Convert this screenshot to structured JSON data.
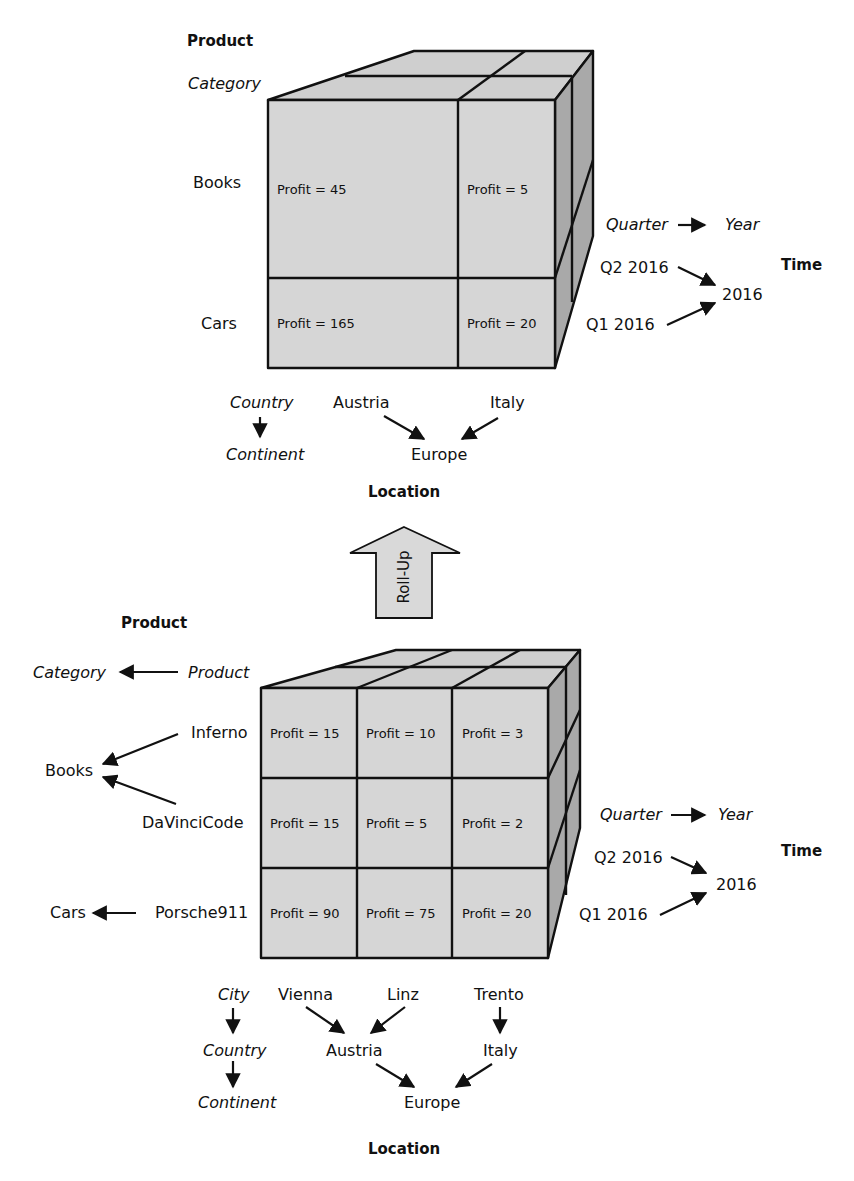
{
  "rolled_up_cube": {
    "product_title": "Product",
    "product_level": "Category",
    "rows": [
      "Books",
      "Cars"
    ],
    "cells": [
      [
        "Profit = 45",
        "Profit = 5"
      ],
      [
        "Profit = 165",
        "Profit = 20"
      ]
    ],
    "time": {
      "title": "Time",
      "hierarchy_from": "Quarter",
      "hierarchy_to": "Year",
      "q2": "Q2 2016",
      "q1": "Q1 2016",
      "year": "2016"
    },
    "location": {
      "title": "Location",
      "level_top": "Country",
      "level_bottom": "Continent",
      "countries": [
        "Austria",
        "Italy"
      ],
      "continent": "Europe"
    }
  },
  "operation": {
    "label": "Roll-Up"
  },
  "base_cube": {
    "product_title": "Product",
    "hierarchy_to": "Category",
    "hierarchy_from": "Product",
    "rows": [
      "Inferno",
      "DaVinciCode",
      "Porsche911"
    ],
    "categories": [
      "Books",
      "Cars"
    ],
    "cells": [
      [
        "Profit = 15",
        "Profit = 10",
        "Profit = 3"
      ],
      [
        "Profit = 15",
        "Profit = 5",
        "Profit = 2"
      ],
      [
        "Profit = 90",
        "Profit = 75",
        "Profit = 20"
      ]
    ],
    "time": {
      "title": "Time",
      "hierarchy_from": "Quarter",
      "hierarchy_to": "Year",
      "q2": "Q2 2016",
      "q1": "Q1 2016",
      "year": "2016"
    },
    "location": {
      "title": "Location",
      "level_top": "City",
      "level_mid": "Country",
      "level_bottom": "Continent",
      "cities": [
        "Vienna",
        "Linz",
        "Trento"
      ],
      "countries": [
        "Austria",
        "Italy"
      ],
      "continent": "Europe"
    }
  },
  "colors": {
    "front_face": "#d6d6d6",
    "top_face": "#cfcfcf",
    "side_face": "#a9a9a9",
    "outline": "#111111",
    "arrow_fill": "#d9d9d9"
  }
}
